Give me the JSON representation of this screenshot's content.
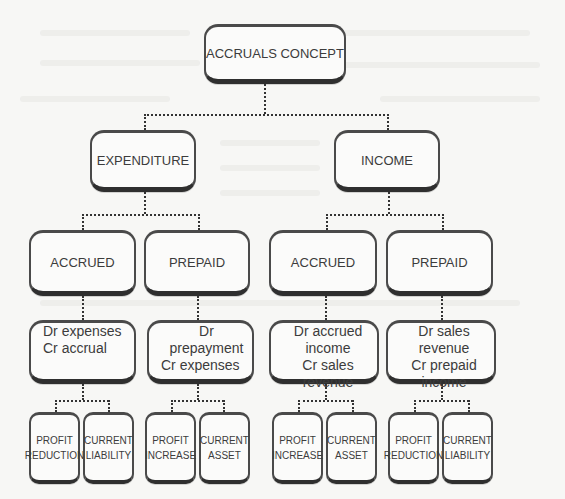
{
  "diagram": {
    "root": {
      "label": "ACCRUALS CONCEPT"
    },
    "branches": [
      {
        "label": "EXPENDITURE",
        "children": [
          {
            "label": "ACCRUED",
            "entry": {
              "line1": "Dr expenses",
              "line2": "Cr accrual"
            },
            "effects": [
              {
                "line1": "PROFIT",
                "line2": "REDUCTION"
              },
              {
                "line1": "CURRENT",
                "line2": "LIABILITY"
              }
            ]
          },
          {
            "label": "PREPAID",
            "entry": {
              "line1": "Dr prepayment",
              "line2": "Cr expenses"
            },
            "effects": [
              {
                "line1": "PROFIT",
                "line2": "INCREASE"
              },
              {
                "line1": "CURRENT",
                "line2": "ASSET"
              }
            ]
          }
        ]
      },
      {
        "label": "INCOME",
        "children": [
          {
            "label": "ACCRUED",
            "entry": {
              "line1": "Dr accrued income",
              "line2": "Cr sales revenue"
            },
            "effects": [
              {
                "line1": "PROFIT",
                "line2": "INCREASE"
              },
              {
                "line1": "CURRENT",
                "line2": "ASSET"
              }
            ]
          },
          {
            "label": "PREPAID",
            "entry": {
              "line1": "Dr sales revenue",
              "line2": "Cr prepaid income"
            },
            "effects": [
              {
                "line1": "PROFIT",
                "line2": "REDUCTION"
              },
              {
                "line1": "CURRENT",
                "line2": "LIABILITY"
              }
            ]
          }
        ]
      }
    ]
  },
  "colors": {
    "background": "#f7f7f5",
    "box_fill": "#fbfbfa",
    "box_border": "#2f2f2f",
    "text": "#3c3c3c",
    "connector": "#333333"
  }
}
